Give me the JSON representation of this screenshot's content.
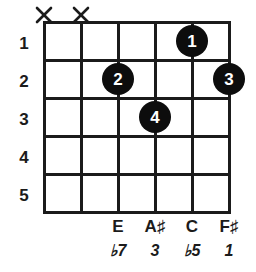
{
  "diagram": {
    "type": "guitar-chord-diagram",
    "string_count": 6,
    "fret_count": 5,
    "dot_color": "#0d0d0d",
    "line_color": "#1b1b1b",
    "background_color": "#ffffff"
  },
  "fret_numbers": [
    {
      "label": "1"
    },
    {
      "label": "2"
    },
    {
      "label": "3"
    },
    {
      "label": "4"
    },
    {
      "label": "5"
    }
  ],
  "muted_strings": [
    {
      "label": "X",
      "string": 1
    },
    {
      "label": "X",
      "string": 2
    }
  ],
  "finger_dots": [
    {
      "label": "1",
      "string": 5,
      "fret": 1
    },
    {
      "label": "2",
      "string": 3,
      "fret": 2
    },
    {
      "label": "3",
      "string": 6,
      "fret": 2
    },
    {
      "label": "4",
      "string": 4,
      "fret": 3
    }
  ],
  "note_labels": [
    {
      "note": "E",
      "interval": "♭7",
      "string": 3
    },
    {
      "note": "A♯",
      "interval": "3",
      "string": 4
    },
    {
      "note": "C",
      "interval": "♭5",
      "string": 5
    },
    {
      "note": "F♯",
      "interval": "1",
      "string": 6
    }
  ]
}
